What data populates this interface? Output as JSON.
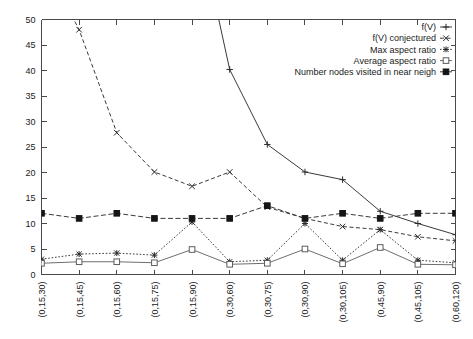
{
  "chart_data": {
    "type": "line",
    "title": "",
    "subtitle": "",
    "xlabel": "",
    "ylabel": "",
    "ylim": [
      0,
      50
    ],
    "ytick_step": 5,
    "yticks": [
      0,
      5,
      10,
      15,
      20,
      25,
      30,
      35,
      40,
      45,
      50
    ],
    "grid": false,
    "legend_position": "top-right",
    "categories": [
      "(0,15,30)",
      "(0,15,45)",
      "(0,15,60)",
      "(0,15,75)",
      "(0,15,90)",
      "(0,30,60)",
      "(0,30,75)",
      "(0,30,90)",
      "(0,30,105)",
      "(0,45,90)",
      "(0,45,105)",
      "(0,60,120)"
    ],
    "series": [
      {
        "name": "f(V)",
        "marker": "plus",
        "linestyle": "solid",
        "values": [
          null,
          null,
          null,
          null,
          74.0,
          40.2,
          25.5,
          20.1,
          18.6,
          12.4,
          10.0,
          7.8
        ]
      },
      {
        "name": "f(V) conjectured",
        "marker": "cross",
        "linestyle": "dashed",
        "values": [
          62.0,
          48.0,
          27.8,
          20.1,
          17.3,
          20.1,
          13.2,
          11.0,
          9.4,
          8.8,
          7.4,
          6.6
        ]
      },
      {
        "name": "Max aspect ratio",
        "marker": "star",
        "linestyle": "dotted",
        "values": [
          3.0,
          4.0,
          4.2,
          3.8,
          10.3,
          2.5,
          2.8,
          10.0,
          2.8,
          8.8,
          2.8,
          2.3
        ]
      },
      {
        "name": "Average aspect ratio",
        "marker": "open-square",
        "linestyle": "solid",
        "values": [
          2.2,
          2.5,
          2.5,
          2.3,
          4.9,
          2.0,
          2.2,
          5.0,
          2.1,
          5.3,
          2.0,
          1.9
        ]
      },
      {
        "name": "Number nodes visited in near neigh",
        "marker": "filled-square",
        "linestyle": "dashed",
        "values": [
          12.0,
          11.0,
          12.0,
          11.0,
          11.0,
          11.0,
          13.5,
          11.0,
          12.0,
          11.0,
          12.0,
          12.0
        ]
      }
    ],
    "legend": [
      "f(V)",
      "f(V) conjectured",
      "Max aspect ratio",
      "Average aspect ratio",
      "Number nodes visited in near neigh"
    ],
    "colors": {
      "axis": "#4a4a4a",
      "series_ink": "#2a2a2a",
      "average_aspect": "#6e6e6e",
      "background": "#ffffff"
    }
  }
}
